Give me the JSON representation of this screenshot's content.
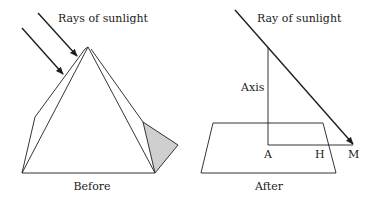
{
  "colors": {
    "line": "#1e1e1e",
    "shadow_fill": "#cfcfcf",
    "background": "#ffffff"
  },
  "before": {
    "ray_label": "Rays of sunlight",
    "caption": "Before",
    "shapes": [
      "pyramid",
      "shadow-triangle",
      "two-sun-rays"
    ]
  },
  "after": {
    "ray_label": "Ray of sunlight",
    "axis_label": "Axis",
    "point_a": "A",
    "point_h": "H",
    "point_m": "M",
    "caption": "After",
    "shapes": [
      "ground-plane",
      "vertical-axis",
      "sun-ray",
      "shadow-line"
    ]
  }
}
